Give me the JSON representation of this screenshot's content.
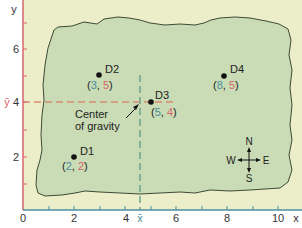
{
  "diagram": {
    "axes": {
      "x_label": "x",
      "y_label": "y",
      "x_ticks": [
        "0",
        "2",
        "4",
        "6",
        "8",
        "10"
      ],
      "y_ticks": [
        "2",
        "4",
        "6"
      ],
      "x_bar_label": "x̄",
      "y_bar_label": "ȳ",
      "x_axis_color": "#4a8fa0",
      "y_axis_color": "#d9646e"
    },
    "points": [
      {
        "id": "D1",
        "label": "D1",
        "x": 2,
        "y": 2,
        "coord_open": "(",
        "coord_x": "2",
        "coord_sep": ", ",
        "coord_y": "2",
        "coord_close": ")"
      },
      {
        "id": "D2",
        "label": "D2",
        "x": 3,
        "y": 5,
        "coord_open": "(",
        "coord_x": "3",
        "coord_sep": ", ",
        "coord_y": "5",
        "coord_close": ")"
      },
      {
        "id": "D3",
        "label": "D3",
        "x": 5,
        "y": 4,
        "coord_open": "(",
        "coord_x": "5",
        "coord_sep": ", ",
        "coord_y": "4",
        "coord_close": ")"
      },
      {
        "id": "D4",
        "label": "D4",
        "x": 8,
        "y": 5,
        "coord_open": "(",
        "coord_x": "8",
        "coord_sep": ", ",
        "coord_y": "5",
        "coord_close": ")"
      }
    ],
    "center_of_gravity": {
      "label_line1": "Center",
      "label_line2": "of gravity",
      "x": 4.6,
      "y": 4.0
    },
    "compass": {
      "n": "N",
      "s": "S",
      "e": "E",
      "w": "W"
    },
    "colors": {
      "background": "#ebeec9",
      "region_fill": "#c9dcb5",
      "region_stroke": "#3f4a35",
      "x_color": "#4a8fa0",
      "y_color": "#d9646e",
      "ybar_line": "#d98a72",
      "xbar_line": "#5f9a88"
    }
  }
}
